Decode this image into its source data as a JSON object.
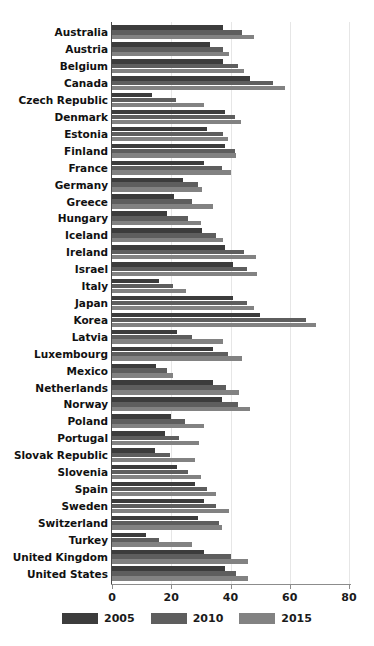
{
  "chart_data": {
    "type": "bar",
    "orientation": "horizontal",
    "title": "",
    "subtitle": "",
    "xlabel": "",
    "ylabel": "",
    "xlim": [
      0,
      80
    ],
    "xticks": [
      0,
      20,
      40,
      60,
      80
    ],
    "xtick_labels": [
      "0",
      "20",
      "40",
      "60",
      "80"
    ],
    "grid": false,
    "legend_position": "bottom",
    "categories": [
      "Australia",
      "Austria",
      "Belgium",
      "Canada",
      "Czech Republic",
      "Denmark",
      "Estonia",
      "Finland",
      "France",
      "Germany",
      "Greece",
      "Hungary",
      "Iceland",
      "Ireland",
      "Israel",
      "Italy",
      "Japan",
      "Korea",
      "Latvia",
      "Luxembourg",
      "Mexico",
      "Netherlands",
      "Norway",
      "Poland",
      "Portugal",
      "Slovak Republic",
      "Slovenia",
      "Spain",
      "Sweden",
      "Switzerland",
      "Turkey",
      "United Kingdom",
      "United States"
    ],
    "series": [
      {
        "name": "2005",
        "color": "#3c3c3c",
        "values": [
          37.5,
          33.0,
          37.5,
          46.5,
          13.5,
          38.0,
          32.0,
          38.0,
          31.0,
          24.0,
          21.0,
          18.5,
          30.5,
          38.0,
          41.0,
          16.0,
          41.0,
          50.0,
          22.0,
          34.0,
          15.0,
          34.0,
          37.0,
          20.0,
          18.0,
          14.5,
          22.0,
          28.0,
          31.0,
          29.0,
          11.5,
          31.0,
          38.0
        ]
      },
      {
        "name": "2010",
        "color": "#5e5e5e",
        "values": [
          44.0,
          37.5,
          42.5,
          54.5,
          21.5,
          41.5,
          37.5,
          41.5,
          37.0,
          29.0,
          27.0,
          25.5,
          35.0,
          44.5,
          45.5,
          20.5,
          45.5,
          65.5,
          27.0,
          39.0,
          18.5,
          38.5,
          42.5,
          24.5,
          22.5,
          19.5,
          25.5,
          32.0,
          35.0,
          36.0,
          16.0,
          40.0,
          42.0
        ]
      },
      {
        "name": "2015",
        "color": "#828282",
        "values": [
          48.0,
          39.5,
          44.5,
          58.5,
          31.0,
          43.5,
          39.0,
          42.0,
          40.0,
          30.5,
          34.0,
          30.0,
          37.5,
          48.5,
          49.0,
          25.0,
          48.0,
          69.0,
          37.5,
          44.0,
          20.5,
          43.0,
          46.5,
          31.0,
          29.5,
          28.0,
          30.0,
          35.0,
          39.5,
          37.0,
          27.0,
          46.0,
          46.0
        ]
      }
    ]
  },
  "legend": {
    "items": [
      {
        "label": "2005",
        "color": "#3c3c3c"
      },
      {
        "label": "2010",
        "color": "#5e5e5e"
      },
      {
        "label": "2015",
        "color": "#828282"
      }
    ]
  }
}
